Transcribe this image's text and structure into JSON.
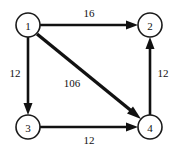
{
  "diagram": {
    "type": "directed-weighted-graph",
    "title": "",
    "background_color": "#ffffff",
    "stroke_color": "#111111",
    "node_fill": "#ffffff",
    "nodes": [
      {
        "id": "1",
        "label": "1",
        "cx": 28,
        "cy": 25,
        "r": 12
      },
      {
        "id": "2",
        "label": "2",
        "cx": 150,
        "cy": 25,
        "r": 12
      },
      {
        "id": "3",
        "label": "3",
        "cx": 28,
        "cy": 127,
        "r": 12
      },
      {
        "id": "4",
        "label": "4",
        "cx": 150,
        "cy": 127,
        "r": 12
      }
    ],
    "edges": [
      {
        "id": "e1",
        "from": "1",
        "to": "2",
        "weight": "16",
        "label_x": 89,
        "label_y": 13,
        "direction": "right",
        "weight_value": 16
      },
      {
        "id": "e2",
        "from": "1",
        "to": "3",
        "weight": "12",
        "label_x": 15,
        "label_y": 73,
        "direction": "down",
        "weight_value": 12
      },
      {
        "id": "e3",
        "from": "1",
        "to": "4",
        "weight": "106",
        "label_x": 72,
        "label_y": 83,
        "direction": "diagonal-down-right",
        "weight_value": 106
      },
      {
        "id": "e4",
        "from": "3",
        "to": "4",
        "weight": "12",
        "label_x": 89,
        "label_y": 140,
        "direction": "right",
        "weight_value": 12
      },
      {
        "id": "e5",
        "from": "4",
        "to": "2",
        "weight": "12",
        "label_x": 163,
        "label_y": 73,
        "direction": "up",
        "weight_value": 12
      }
    ]
  }
}
